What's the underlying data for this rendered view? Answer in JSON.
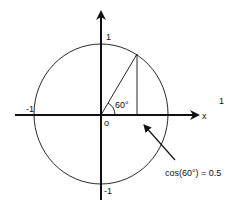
{
  "diagram": {
    "angle_degrees": 60,
    "labels": {
      "y_top": "1",
      "x_left": "-1",
      "y_bottom": "-1",
      "origin": "o",
      "angle": "60°",
      "x_axis": "x",
      "stray_one": "1",
      "annotation": "cos(60°) = 0.5"
    },
    "cos_value": 0.5,
    "colors": {
      "stroke": "#111111",
      "background": "#ffffff"
    }
  }
}
